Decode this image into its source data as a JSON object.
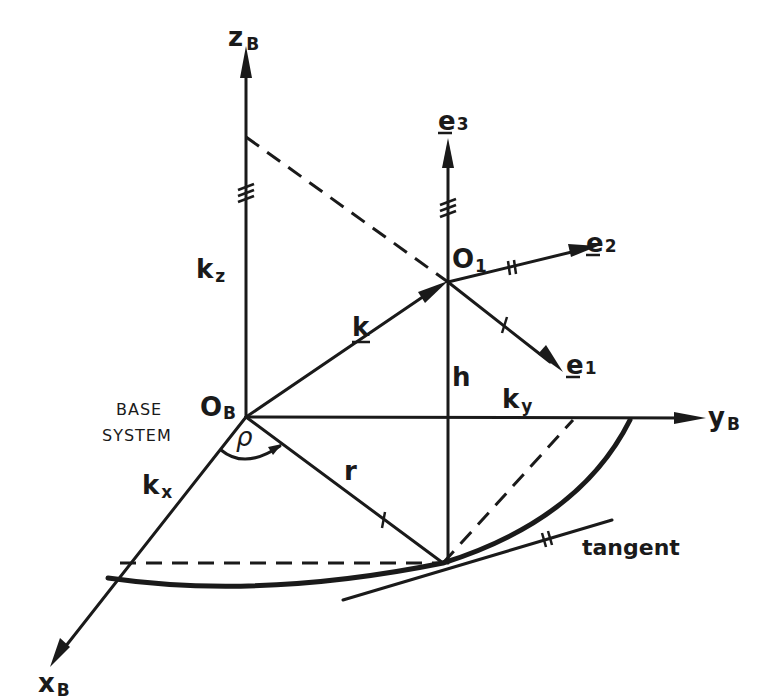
{
  "diagram": {
    "type": "3d-coordinate-system",
    "colors": {
      "ink": "#1a1a1a",
      "background": "#ffffff"
    },
    "base_system": {
      "label_line1": "BASE",
      "label_line2": "SYSTEM",
      "origin": {
        "main": "O",
        "sub": "B"
      },
      "axes": {
        "z": {
          "main": "z",
          "sub": "B"
        },
        "y": {
          "main": "y",
          "sub": "B"
        },
        "x": {
          "main": "x",
          "sub": "B"
        }
      }
    },
    "local_system": {
      "origin": {
        "main": "O",
        "sub": "1"
      },
      "e1": {
        "main": "e",
        "sub": "1"
      },
      "e2": {
        "main": "e",
        "sub": "2"
      },
      "e3": {
        "main": "e",
        "sub": "3"
      }
    },
    "vectors": {
      "k": "k",
      "kx": {
        "main": "k",
        "sub": "x"
      },
      "ky": {
        "main": "k",
        "sub": "y"
      },
      "kz": {
        "main": "k",
        "sub": "z"
      }
    },
    "quantities": {
      "h": "h",
      "r": "r",
      "rho": "ρ"
    },
    "annotations": {
      "tangent": "tangent"
    }
  }
}
